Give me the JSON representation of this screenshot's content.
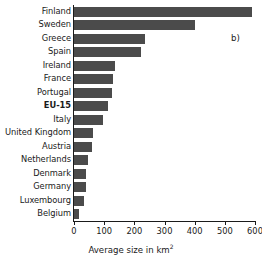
{
  "chart_data": {
    "type": "bar",
    "orientation": "horizontal",
    "title": "",
    "subtitle": "",
    "panel_label": "b)",
    "xlabel": "Average size in km",
    "xlabel_superscript": "2",
    "ylabel": "",
    "xlim": [
      0,
      600
    ],
    "xticks": [
      0,
      100,
      200,
      300,
      400,
      500,
      600
    ],
    "xtick_labels": [
      "0",
      "100",
      "200",
      "300",
      "400",
      "500",
      "600"
    ],
    "grid": false,
    "legend": null,
    "bar_color": "#4b4b4b",
    "axis_color": "#1a1a1a",
    "emphasized_category": "EU-15",
    "categories": [
      "Finland",
      "Sweden",
      "Greece",
      "Spain",
      "Ireland",
      "France",
      "Portugal",
      "EU-15",
      "Italy",
      "United Kingdom",
      "Austria",
      "Netherlands",
      "Denmark",
      "Germany",
      "Luxembourg",
      "Belgium"
    ],
    "values": [
      590,
      400,
      235,
      222,
      137,
      130,
      126,
      113,
      97,
      62,
      60,
      47,
      40,
      40,
      32,
      15
    ],
    "units": "km2"
  }
}
